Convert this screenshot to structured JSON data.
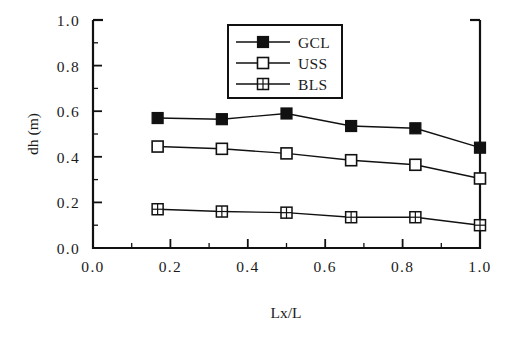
{
  "chart_data": {
    "type": "line",
    "title": "",
    "xlabel": "Lx/L",
    "ylabel": "dh (m)",
    "xlim": [
      0.0,
      1.0
    ],
    "ylim": [
      0.0,
      1.0
    ],
    "grid": false,
    "legend_position": "top-center",
    "x": [
      0.167,
      0.333,
      0.5,
      0.667,
      0.833,
      1.0
    ],
    "xticks": [
      "0.0",
      "0.2",
      "0.4",
      "0.6",
      "0.8",
      "1.0"
    ],
    "xtick_values": [
      0.0,
      0.2,
      0.4,
      0.6,
      0.8,
      1.0
    ],
    "xminor_values": [
      0.1,
      0.3,
      0.5,
      0.7,
      0.9
    ],
    "yticks": [
      "0.0",
      "0.2",
      "0.4",
      "0.6",
      "0.8",
      "1.0"
    ],
    "ytick_values": [
      0.0,
      0.2,
      0.4,
      0.6,
      0.8,
      1.0
    ],
    "yminor_values": [
      0.1,
      0.3,
      0.5,
      0.7,
      0.9
    ],
    "series": [
      {
        "name": "GCL",
        "marker": "filled-square",
        "values": [
          0.57,
          0.565,
          0.59,
          0.535,
          0.525,
          0.44
        ]
      },
      {
        "name": "USS",
        "marker": "open-square",
        "values": [
          0.445,
          0.435,
          0.415,
          0.385,
          0.365,
          0.305
        ]
      },
      {
        "name": "BLS",
        "marker": "crossed-square",
        "values": [
          0.17,
          0.16,
          0.155,
          0.135,
          0.135,
          0.1
        ]
      }
    ],
    "colors": {
      "line": "#111111",
      "marker_fill": "#111111",
      "marker_open_fill": "#ffffff",
      "background": "#ffffff"
    }
  },
  "legend": {
    "entries": [
      {
        "label": "GCL"
      },
      {
        "label": "USS"
      },
      {
        "label": "BLS"
      }
    ]
  }
}
